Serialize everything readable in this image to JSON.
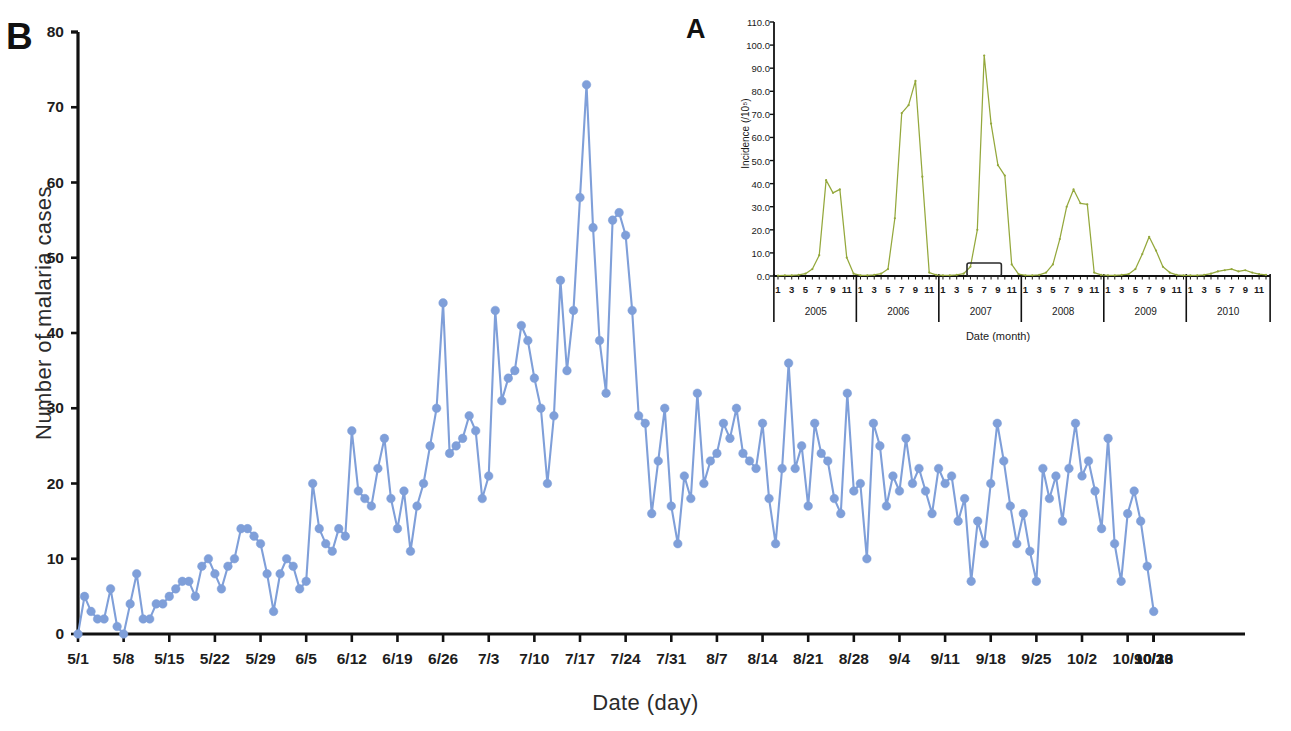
{
  "figure": {
    "panel_b_letter": "B",
    "panel_a_letter": "A"
  },
  "chart_data": [
    {
      "id": "panel_b",
      "type": "line",
      "title": "",
      "xlabel": "Date (day)",
      "ylabel": "Number of malaria cases",
      "ylim": [
        0,
        80
      ],
      "ytick_labels": [
        "0",
        "10",
        "20",
        "30",
        "40",
        "50",
        "60",
        "70",
        "80"
      ],
      "ytick_values": [
        0,
        10,
        20,
        30,
        40,
        50,
        60,
        70,
        80
      ],
      "grid": false,
      "legend": "none",
      "series_color": "#7f9fd9",
      "marker": "circle",
      "xtick_labels": [
        "5/1",
        "5/8",
        "5/15",
        "5/22",
        "5/29",
        "6/5",
        "6/12",
        "6/19",
        "6/26",
        "7/3",
        "7/10",
        "7/17",
        "7/24",
        "7/31",
        "8/7",
        "8/14",
        "8/21",
        "8/28",
        "9/4",
        "9/11",
        "9/18",
        "9/25",
        "10/2",
        "10/9",
        "10/16",
        "10/23",
        "10/30"
      ],
      "x_start_label": "5/1",
      "x_end_label": "10/30",
      "x": [
        "5/1",
        "5/2",
        "5/3",
        "5/4",
        "5/5",
        "5/6",
        "5/7",
        "5/8",
        "5/9",
        "5/10",
        "5/11",
        "5/12",
        "5/13",
        "5/14",
        "5/15",
        "5/16",
        "5/17",
        "5/18",
        "5/19",
        "5/20",
        "5/21",
        "5/22",
        "5/23",
        "5/24",
        "5/25",
        "5/26",
        "5/27",
        "5/28",
        "5/29",
        "5/30",
        "5/31",
        "6/1",
        "6/2",
        "6/3",
        "6/4",
        "6/5",
        "6/6",
        "6/7",
        "6/8",
        "6/9",
        "6/10",
        "6/11",
        "6/12",
        "6/13",
        "6/14",
        "6/15",
        "6/16",
        "6/17",
        "6/18",
        "6/19",
        "6/20",
        "6/21",
        "6/22",
        "6/23",
        "6/24",
        "6/25",
        "6/26",
        "6/27",
        "6/28",
        "6/29",
        "6/30",
        "7/1",
        "7/2",
        "7/3",
        "7/4",
        "7/5",
        "7/6",
        "7/7",
        "7/8",
        "7/9",
        "7/10",
        "7/11",
        "7/12",
        "7/13",
        "7/14",
        "7/15",
        "7/16",
        "7/17",
        "7/18",
        "7/19",
        "7/20",
        "7/21",
        "7/22",
        "7/23",
        "7/24",
        "7/25",
        "7/26",
        "7/27",
        "7/28",
        "7/29",
        "7/30",
        "7/31",
        "8/1",
        "8/2",
        "8/3",
        "8/4",
        "8/5",
        "8/6",
        "8/7",
        "8/8",
        "8/9",
        "8/10",
        "8/11",
        "8/12",
        "8/13",
        "8/14",
        "8/15",
        "8/16",
        "8/17",
        "8/18",
        "8/19",
        "8/20",
        "8/21",
        "8/22",
        "8/23",
        "8/24",
        "8/25",
        "8/26",
        "8/27",
        "8/28",
        "8/29",
        "8/30",
        "8/31",
        "9/1",
        "9/2",
        "9/3",
        "9/4",
        "9/5",
        "9/6",
        "9/7",
        "9/8",
        "9/9",
        "9/10",
        "9/11",
        "9/12",
        "9/13",
        "9/14",
        "9/15",
        "9/16",
        "9/17",
        "9/18",
        "9/19",
        "9/20",
        "9/21",
        "9/22",
        "9/23",
        "9/24",
        "9/25",
        "9/26",
        "9/27",
        "9/28",
        "9/29",
        "9/30",
        "10/1",
        "10/2",
        "10/3",
        "10/4",
        "10/5",
        "10/6",
        "10/7",
        "10/8",
        "10/9",
        "10/10",
        "10/11",
        "10/12",
        "10/13",
        "10/14",
        "10/15",
        "10/16",
        "10/17",
        "10/18",
        "10/19",
        "10/20",
        "10/21",
        "10/22",
        "10/23",
        "10/24",
        "10/25",
        "10/26",
        "10/27",
        "10/28",
        "10/29",
        "10/30"
      ],
      "values": [
        0,
        5,
        3,
        2,
        2,
        6,
        1,
        0,
        4,
        8,
        2,
        2,
        4,
        4,
        5,
        6,
        7,
        7,
        5,
        9,
        10,
        8,
        6,
        9,
        10,
        14,
        14,
        13,
        12,
        8,
        3,
        8,
        10,
        9,
        6,
        7,
        20,
        14,
        12,
        11,
        14,
        13,
        27,
        19,
        18,
        17,
        22,
        26,
        18,
        14,
        19,
        11,
        17,
        20,
        25,
        30,
        44,
        24,
        25,
        26,
        29,
        27,
        18,
        21,
        43,
        31,
        34,
        35,
        41,
        39,
        34,
        30,
        20,
        29,
        47,
        35,
        43,
        58,
        73,
        54,
        39,
        32,
        55,
        56,
        53,
        43,
        29,
        28,
        16,
        23,
        30,
        17,
        12,
        21,
        18,
        32,
        20,
        23,
        24,
        28,
        26,
        30,
        24,
        23,
        22,
        28,
        18,
        12,
        22,
        36,
        22,
        25,
        17,
        28,
        24,
        23,
        18,
        16,
        32,
        19,
        20,
        10,
        28,
        25,
        17,
        21,
        19,
        26,
        20,
        22,
        19,
        16,
        22,
        20,
        21,
        15,
        18,
        7,
        15,
        12,
        20,
        28,
        23,
        17,
        12,
        16,
        11,
        7,
        22,
        18,
        21,
        15,
        22,
        28,
        21,
        23,
        19,
        14,
        26,
        12,
        7,
        16,
        19,
        15,
        9,
        3
      ]
    },
    {
      "id": "panel_a_inset",
      "type": "line",
      "title": "",
      "xlabel": "Date (month)",
      "ylabel": "Incidence (/10⁵)",
      "ylim": [
        0,
        110
      ],
      "ytick_labels": [
        "0.0",
        "10.0",
        "20.0",
        "30.0",
        "40.0",
        "50.0",
        "60.0",
        "70.0",
        "80.0",
        "90.0",
        "100.0",
        "110.0"
      ],
      "ytick_values": [
        0,
        10,
        20,
        30,
        40,
        50,
        60,
        70,
        80,
        90,
        100,
        110
      ],
      "grid": false,
      "legend": "none",
      "series_color": "#94a83c",
      "years": [
        "2005",
        "2006",
        "2007",
        "2008",
        "2009",
        "2010"
      ],
      "month_tick_labels": [
        "1",
        "3",
        "5",
        "7",
        "9",
        "11"
      ],
      "highlight_box_note": "outbreak period box over months 5-9 of 2007",
      "x": [
        "2005-1",
        "2005-2",
        "2005-3",
        "2005-4",
        "2005-5",
        "2005-6",
        "2005-7",
        "2005-8",
        "2005-9",
        "2005-10",
        "2005-11",
        "2005-12",
        "2006-1",
        "2006-2",
        "2006-3",
        "2006-4",
        "2006-5",
        "2006-6",
        "2006-7",
        "2006-8",
        "2006-9",
        "2006-10",
        "2006-11",
        "2006-12",
        "2007-1",
        "2007-2",
        "2007-3",
        "2007-4",
        "2007-5",
        "2007-6",
        "2007-7",
        "2007-8",
        "2007-9",
        "2007-10",
        "2007-11",
        "2007-12",
        "2008-1",
        "2008-2",
        "2008-3",
        "2008-4",
        "2008-5",
        "2008-6",
        "2008-7",
        "2008-8",
        "2008-9",
        "2008-10",
        "2008-11",
        "2008-12",
        "2009-1",
        "2009-2",
        "2009-3",
        "2009-4",
        "2009-5",
        "2009-6",
        "2009-7",
        "2009-8",
        "2009-9",
        "2009-10",
        "2009-11",
        "2009-12",
        "2010-1",
        "2010-2",
        "2010-3",
        "2010-4",
        "2010-5",
        "2010-6",
        "2010-7",
        "2010-8",
        "2010-9",
        "2010-10",
        "2010-11",
        "2010-12"
      ],
      "values": [
        0.2,
        0.3,
        0.3,
        0.5,
        1.0,
        3.0,
        9.0,
        41.5,
        36.0,
        37.5,
        8.0,
        1.0,
        0.3,
        0.3,
        0.5,
        1.0,
        3.0,
        25.0,
        70.5,
        74.0,
        84.5,
        43.0,
        1.5,
        0.5,
        0.3,
        0.3,
        0.5,
        1.0,
        4.0,
        20.0,
        95.5,
        66.0,
        48.0,
        43.5,
        5.0,
        0.8,
        0.3,
        0.3,
        0.5,
        1.5,
        5.0,
        16.0,
        30.0,
        37.5,
        31.5,
        31.0,
        1.5,
        0.5,
        0.3,
        0.3,
        0.5,
        0.8,
        3.0,
        9.5,
        17.0,
        11.0,
        4.0,
        1.5,
        0.5,
        0.3,
        0.3,
        0.3,
        0.5,
        1.0,
        2.0,
        2.5,
        3.0,
        2.0,
        2.5,
        1.5,
        0.8,
        0.5
      ]
    }
  ]
}
